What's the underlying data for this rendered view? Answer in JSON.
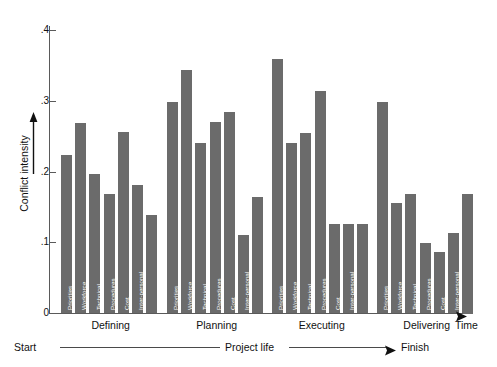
{
  "chart_data": {
    "type": "bar",
    "title": "",
    "xlabel": "Time",
    "ylabel": "Conflict intensity",
    "ylim": [
      0,
      0.4
    ],
    "yticks": [
      0,
      0.1,
      0.2,
      0.3,
      0.4
    ],
    "ytick_labels": [
      "0",
      ".1",
      ".2",
      ".3",
      ".4"
    ],
    "grid": false,
    "legend": "none",
    "bar_color": "#6b6b6b",
    "axis_color": "#5a5a5a",
    "categories": [
      "Schedules",
      "Priorities",
      "Workforce",
      "Technical",
      "Procedures",
      "Cost",
      "Inter-personal"
    ],
    "groups": [
      "Defining",
      "Planning",
      "Executing",
      "Delivering"
    ],
    "series": [
      {
        "name": "Defining",
        "values": [
          0.225,
          0.27,
          0.198,
          0.17,
          0.257,
          0.183,
          0.14
        ]
      },
      {
        "name": "Planning",
        "values": [
          0.3,
          0.345,
          0.242,
          0.272,
          0.285,
          0.112,
          0.166
        ]
      },
      {
        "name": "Executing",
        "values": [
          0.36,
          0.242,
          0.256,
          0.315,
          0.127,
          0.127,
          0.127
        ]
      },
      {
        "name": "Delivering",
        "values": [
          0.3,
          0.157,
          0.17,
          0.1,
          0.088,
          0.115,
          0.17
        ]
      }
    ]
  },
  "axes": {
    "y_title": "Conflict intensity",
    "x_title": "Time"
  },
  "timeline": {
    "start_label": "Start",
    "middle_label": "Project life",
    "finish_label": "Finish"
  }
}
